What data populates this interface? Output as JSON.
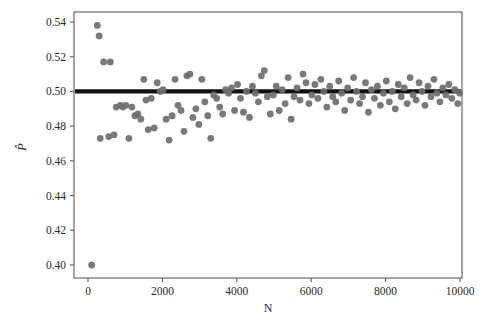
{
  "figure": {
    "name": "scatter-plot-proportion-vs-n",
    "background": "#ffffff",
    "marker_color": "#6e6e6e",
    "reference_line_color": "#111111",
    "axis_color": "#5b5b5b"
  },
  "chart_data": {
    "type": "scatter",
    "title": "",
    "xlabel": "N",
    "ylabel": "P̂",
    "xlim": [
      0,
      10000
    ],
    "ylim": [
      0.395,
      0.546
    ],
    "grid": false,
    "legend": null,
    "xticks": [
      0,
      2000,
      4000,
      6000,
      8000,
      10000
    ],
    "xtick_labels": [
      "0",
      "2000",
      "4000",
      "6000",
      "8000",
      "10000"
    ],
    "yticks": [
      0.4,
      0.42,
      0.44,
      0.46,
      0.48,
      0.5,
      0.52,
      0.54
    ],
    "ytick_labels": [
      "0.40",
      "0.42",
      "0.44",
      "0.46",
      "0.48",
      "0.50",
      "0.52",
      "0.54"
    ],
    "reference_line": {
      "orientation": "horizontal",
      "y": 0.5,
      "label": "0.50",
      "width_px": 4.2
    },
    "marker": {
      "shape": "circle",
      "radius_px": 3.4,
      "color": "#6e6e6e",
      "opacity": 0.92
    },
    "series": [
      {
        "name": "P-hat estimates",
        "points": [
          [
            100,
            0.4
          ],
          [
            250,
            0.538
          ],
          [
            300,
            0.532
          ],
          [
            330,
            0.473
          ],
          [
            420,
            0.517
          ],
          [
            560,
            0.474
          ],
          [
            600,
            0.517
          ],
          [
            700,
            0.475
          ],
          [
            760,
            0.491
          ],
          [
            870,
            0.492
          ],
          [
            940,
            0.491
          ],
          [
            1020,
            0.492
          ],
          [
            1100,
            0.473
          ],
          [
            1180,
            0.491
          ],
          [
            1260,
            0.486
          ],
          [
            1340,
            0.487
          ],
          [
            1420,
            0.484
          ],
          [
            1500,
            0.507
          ],
          [
            1560,
            0.495
          ],
          [
            1620,
            0.478
          ],
          [
            1700,
            0.496
          ],
          [
            1780,
            0.479
          ],
          [
            1860,
            0.505
          ],
          [
            1940,
            0.5
          ],
          [
            2020,
            0.501
          ],
          [
            2100,
            0.484
          ],
          [
            2180,
            0.472
          ],
          [
            2260,
            0.486
          ],
          [
            2340,
            0.507
          ],
          [
            2420,
            0.492
          ],
          [
            2500,
            0.489
          ],
          [
            2580,
            0.477
          ],
          [
            2660,
            0.509
          ],
          [
            2740,
            0.51
          ],
          [
            2820,
            0.485
          ],
          [
            2900,
            0.49
          ],
          [
            2980,
            0.481
          ],
          [
            3060,
            0.507
          ],
          [
            3140,
            0.494
          ],
          [
            3220,
            0.486
          ],
          [
            3300,
            0.473
          ],
          [
            3380,
            0.498
          ],
          [
            3460,
            0.496
          ],
          [
            3540,
            0.491
          ],
          [
            3620,
            0.487
          ],
          [
            3700,
            0.501
          ],
          [
            3780,
            0.499
          ],
          [
            3860,
            0.502
          ],
          [
            3940,
            0.489
          ],
          [
            4020,
            0.504
          ],
          [
            4100,
            0.496
          ],
          [
            4180,
            0.488
          ],
          [
            4260,
            0.5
          ],
          [
            4340,
            0.485
          ],
          [
            4420,
            0.503
          ],
          [
            4500,
            0.499
          ],
          [
            4580,
            0.494
          ],
          [
            4660,
            0.509
          ],
          [
            4740,
            0.512
          ],
          [
            4820,
            0.497
          ],
          [
            4900,
            0.487
          ],
          [
            4980,
            0.498
          ],
          [
            5060,
            0.503
          ],
          [
            5140,
            0.489
          ],
          [
            5220,
            0.501
          ],
          [
            5300,
            0.493
          ],
          [
            5380,
            0.508
          ],
          [
            5460,
            0.484
          ],
          [
            5540,
            0.497
          ],
          [
            5620,
            0.502
          ],
          [
            5700,
            0.495
          ],
          [
            5780,
            0.51
          ],
          [
            5860,
            0.505
          ],
          [
            5940,
            0.493
          ],
          [
            6020,
            0.498
          ],
          [
            6100,
            0.504
          ],
          [
            6180,
            0.496
          ],
          [
            6260,
            0.507
          ],
          [
            6340,
            0.5
          ],
          [
            6420,
            0.491
          ],
          [
            6500,
            0.503
          ],
          [
            6580,
            0.497
          ],
          [
            6660,
            0.494
          ],
          [
            6740,
            0.506
          ],
          [
            6820,
            0.499
          ],
          [
            6900,
            0.489
          ],
          [
            6980,
            0.502
          ],
          [
            7060,
            0.495
          ],
          [
            7140,
            0.508
          ],
          [
            7220,
            0.5
          ],
          [
            7300,
            0.493
          ],
          [
            7380,
            0.497
          ],
          [
            7460,
            0.505
          ],
          [
            7540,
            0.488
          ],
          [
            7620,
            0.501
          ],
          [
            7700,
            0.496
          ],
          [
            7780,
            0.503
          ],
          [
            7860,
            0.492
          ],
          [
            7940,
            0.499
          ],
          [
            8020,
            0.506
          ],
          [
            8100,
            0.494
          ],
          [
            8180,
            0.5
          ],
          [
            8260,
            0.49
          ],
          [
            8340,
            0.504
          ],
          [
            8420,
            0.497
          ],
          [
            8500,
            0.502
          ],
          [
            8580,
            0.493
          ],
          [
            8660,
            0.508
          ],
          [
            8740,
            0.498
          ],
          [
            8820,
            0.495
          ],
          [
            8900,
            0.505
          ],
          [
            8980,
            0.5
          ],
          [
            9060,
            0.492
          ],
          [
            9140,
            0.503
          ],
          [
            9220,
            0.497
          ],
          [
            9300,
            0.507
          ],
          [
            9380,
            0.499
          ],
          [
            9460,
            0.494
          ],
          [
            9540,
            0.502
          ],
          [
            9620,
            0.498
          ],
          [
            9700,
            0.504
          ],
          [
            9780,
            0.496
          ],
          [
            9860,
            0.501
          ],
          [
            9940,
            0.493
          ],
          [
            9990,
            0.499
          ]
        ]
      }
    ]
  }
}
